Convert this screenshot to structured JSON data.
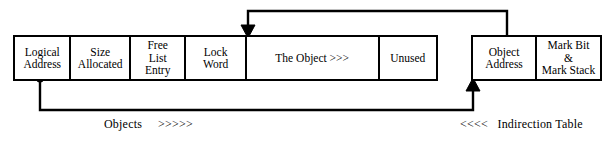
{
  "diagram": {
    "stroke_color": "#000000",
    "background_color": "#ffffff",
    "object_table": {
      "name": "object-record",
      "fields": [
        {
          "id": "logical-address",
          "label": "Logical\nAddress"
        },
        {
          "id": "size-allocated",
          "label": "Size\nAllocated"
        },
        {
          "id": "free-list-entry",
          "label": "Free\nList\nEntry"
        },
        {
          "id": "lock-word",
          "label": "Lock\nWord"
        },
        {
          "id": "the-object",
          "label": "The Object >>>"
        },
        {
          "id": "unused",
          "label": "Unused"
        }
      ]
    },
    "indirection_table": {
      "name": "indirection-record",
      "fields": [
        {
          "id": "object-address",
          "label": "Object\nAddress"
        },
        {
          "id": "mark-bit-mark-stack",
          "label": "Mark Bit\n&\nMark Stack"
        }
      ]
    },
    "captions": {
      "objects": "Objects     >>>>>",
      "indirection": "<<<<   Indirection Table"
    },
    "connectors": [
      {
        "id": "object-address-to-object",
        "from": "object-address",
        "to": "the-object",
        "direction": "down-arrow",
        "arrow_x": 247,
        "arrow_y": 35
      },
      {
        "id": "logical-address-to-object-address",
        "from": "logical-address",
        "to": "object-address",
        "direction": "up-arrow",
        "arrow_x": 473,
        "arrow_y": 81
      }
    ]
  }
}
